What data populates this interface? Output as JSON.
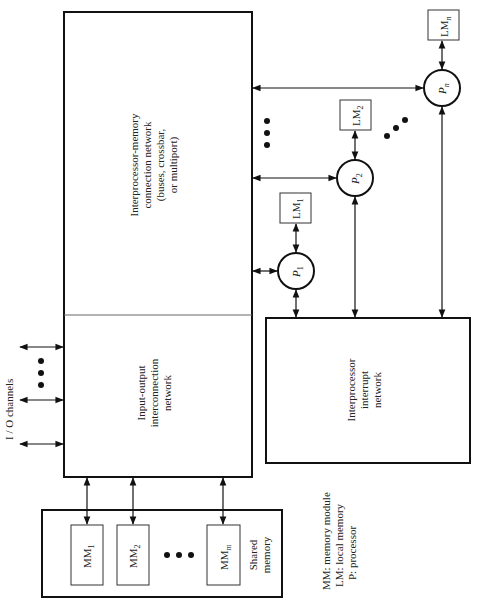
{
  "diagram": {
    "orientation": "rotated -90deg",
    "io_channels": {
      "label": "I / O channels"
    },
    "interprocessor_memory_network": {
      "lines": [
        "Interprocessor-memory",
        "connection network",
        "(buses, crossbar,",
        "or multiport)"
      ]
    },
    "io_interconnection_network": {
      "lines": [
        "Input-output",
        "interconnection",
        "network"
      ]
    },
    "interrupt_network": {
      "lines": [
        "Interprocessor",
        "interrupt",
        "network"
      ]
    },
    "shared_memory": {
      "lines": [
        "Shared",
        "memory"
      ],
      "modules": [
        {
          "base": "MM",
          "sub": "1"
        },
        {
          "base": "MM",
          "sub": "2"
        },
        {
          "base": "MM",
          "sub": "m"
        }
      ]
    },
    "processors": [
      {
        "base": "P",
        "sub": "1",
        "lm_base": "LM",
        "lm_sub": "1"
      },
      {
        "base": "P",
        "sub": "2",
        "lm_base": "LM",
        "lm_sub": "2"
      },
      {
        "base": "P",
        "sub": "n",
        "lm_base": "LM",
        "lm_sub": "n"
      }
    ],
    "legend": [
      "MM: memory module",
      "LM: local memory",
      "P: processor"
    ],
    "colors": {
      "stroke": "#111111",
      "background": "#ffffff"
    }
  }
}
